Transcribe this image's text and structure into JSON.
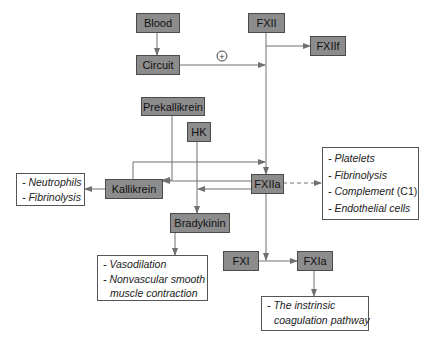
{
  "nodes": {
    "blood": "Blood",
    "circuit": "Circuit",
    "fxii": "FXII",
    "fxiif": "FXIIf",
    "prekallikrein": "Prekallikrein",
    "hk": "HK",
    "kallikrein": "Kallikrein",
    "fxiia": "FXIIa",
    "bradykinin": "Bradykinin",
    "fxi": "FXI",
    "fxia": "FXIa"
  },
  "notes": {
    "kallikrein_effects": [
      "- Neutrophils",
      "- Fibrinolysis"
    ],
    "fxiia_effects": {
      "items": [
        "- Platelets",
        "- Fibrinolysis",
        "- Complement ",
        "- Endothelial cells"
      ],
      "complement_suffix": "(C1)"
    },
    "bradykinin_effects": {
      "line1": "- Vasodilation",
      "line2": "- Nonvascular smooth",
      "line3": "muscle contraction"
    },
    "fxia_effects": {
      "line1": "- The instrinsic",
      "line2": "coagulation pathway"
    }
  },
  "symbols": {
    "plus": "+"
  },
  "colors": {
    "node_fill": "#8c8c8c",
    "line": "#707070"
  }
}
